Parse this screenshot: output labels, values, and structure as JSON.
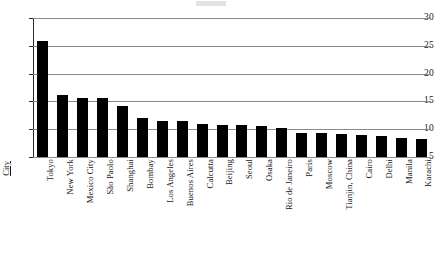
{
  "chart_data": {
    "type": "bar",
    "title": "",
    "xlabel": "City",
    "ylabel": "",
    "ylim": [
      5,
      30
    ],
    "grid": true,
    "legend": "none",
    "yticks": [
      30,
      25,
      20,
      15,
      10,
      5
    ],
    "categories": [
      "Tokyo",
      "New York",
      "Mexico City",
      "São Paolo",
      "Shanghai",
      "Bombay",
      "Los Angeles",
      "Buenos Aires",
      "Calcutta",
      "Beijing",
      "Seoul",
      "Osaka",
      "Rio de Janeiro",
      "Paris",
      "Moscow",
      "Tianjin, China",
      "Cairo",
      "Delhi",
      "Manila",
      "Karachi"
    ],
    "values": [
      25.8,
      16.1,
      15.6,
      15.6,
      14.1,
      12.0,
      11.5,
      11.4,
      11.0,
      10.8,
      10.8,
      10.6,
      10.2,
      9.4,
      9.3,
      9.2,
      9.0,
      8.8,
      8.5,
      8.3
    ],
    "colors": {
      "bar": "#000000",
      "gridline": "#8a8a8a",
      "axis": "#2a2a2a",
      "text": "#161616",
      "background": "#ffffff"
    }
  }
}
